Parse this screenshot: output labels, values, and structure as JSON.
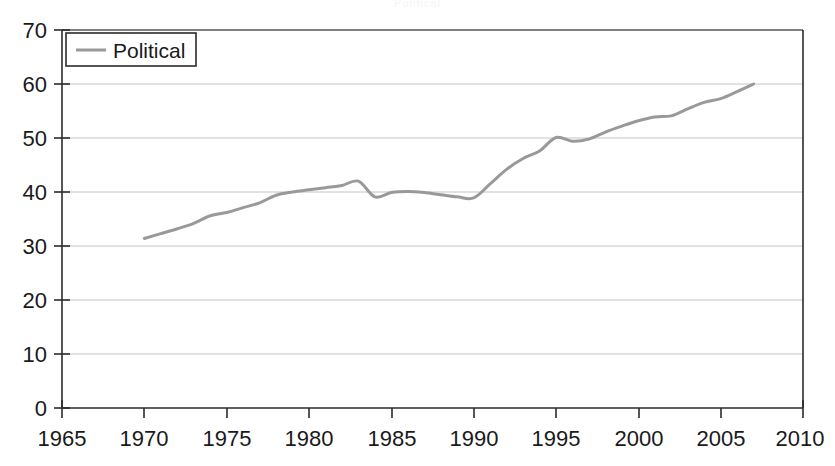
{
  "chart_data": {
    "type": "line",
    "title": "Political",
    "subtitle": "",
    "xlabel": "",
    "ylabel": "",
    "xlim": [
      1965,
      2010
    ],
    "ylim": [
      0,
      70
    ],
    "xticks": [
      1965,
      1970,
      1975,
      1980,
      1985,
      1990,
      1995,
      2000,
      2005,
      2010
    ],
    "xtick_labels": [
      "1965",
      "1970",
      "1975",
      "1980",
      "1985",
      "1990",
      "1995",
      "2000",
      "2005",
      "2010"
    ],
    "yticks": [
      0,
      10,
      20,
      30,
      40,
      50,
      60,
      70
    ],
    "ytick_labels": [
      "0",
      "10",
      "20",
      "30",
      "40",
      "50",
      "60",
      "70"
    ],
    "grid": true,
    "grid_axis": "y",
    "legend": {
      "position": "top-left",
      "entries": [
        {
          "label": "Political",
          "color": "#999999"
        }
      ]
    },
    "series": [
      {
        "name": "Political",
        "color": "#999999",
        "line_width": 3,
        "x": [
          1970,
          1971,
          1972,
          1973,
          1974,
          1975,
          1976,
          1977,
          1978,
          1979,
          1980,
          1981,
          1982,
          1983,
          1984,
          1985,
          1986,
          1987,
          1988,
          1989,
          1990,
          1991,
          1992,
          1993,
          1994,
          1995,
          1996,
          1997,
          1998,
          1999,
          2000,
          2001,
          2002,
          2003,
          2004,
          2005,
          2006,
          2007
        ],
        "values": [
          31.4,
          32.3,
          33.2,
          34.2,
          35.6,
          36.2,
          37.1,
          38.0,
          39.4,
          40.0,
          40.4,
          40.8,
          41.2,
          42.0,
          39.1,
          39.9,
          40.1,
          39.9,
          39.5,
          39.1,
          38.9,
          41.5,
          44.2,
          46.2,
          47.6,
          50.1,
          49.4,
          49.8,
          51.1,
          52.2,
          53.2,
          53.9,
          54.1,
          55.4,
          56.6,
          57.3,
          58.6,
          60.0
        ]
      }
    ]
  },
  "axis": {
    "y_label_0": "0",
    "y_label_10": "10",
    "y_label_20": "20",
    "y_label_30": "30",
    "y_label_40": "40",
    "y_label_50": "50",
    "y_label_60": "60",
    "y_label_70": "70",
    "x_label_1965": "1965",
    "x_label_1970": "1970",
    "x_label_1975": "1975",
    "x_label_1980": "1980",
    "x_label_1985": "1985",
    "x_label_1990": "1990",
    "x_label_1995": "1995",
    "x_label_2000": "2000",
    "x_label_2005": "2005",
    "x_label_2010": "2010"
  },
  "legend": {
    "series_label": "Political"
  },
  "colors": {
    "line": "#999999",
    "axis": "#2b2b2b",
    "grid": "#bfbfbf",
    "text": "#1a1a1a",
    "background": "#ffffff"
  }
}
